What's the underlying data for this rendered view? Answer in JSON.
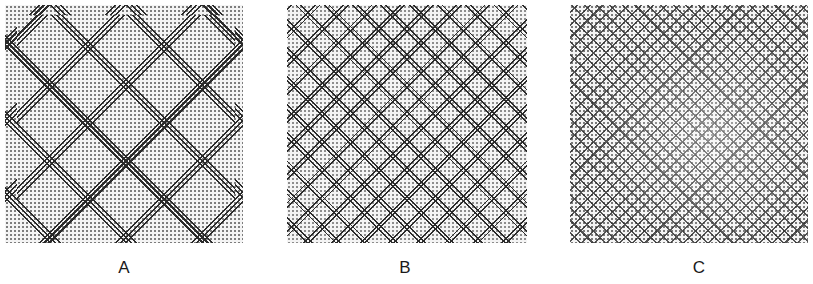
{
  "figure": {
    "panels": [
      {
        "id": "A",
        "label": "A",
        "pattern": "coarse diamond lattice of double/triple diagonal lines over dot halftone",
        "lattice_period_px": 54
      },
      {
        "id": "B",
        "label": "B",
        "pattern": "medium diamond lattice of double diagonal lines over dot halftone",
        "lattice_period_px": 20
      },
      {
        "id": "C",
        "label": "C",
        "pattern": "fine diamond lattice of small diamond outlines over dot halftone",
        "lattice_period_px": 9
      }
    ]
  }
}
